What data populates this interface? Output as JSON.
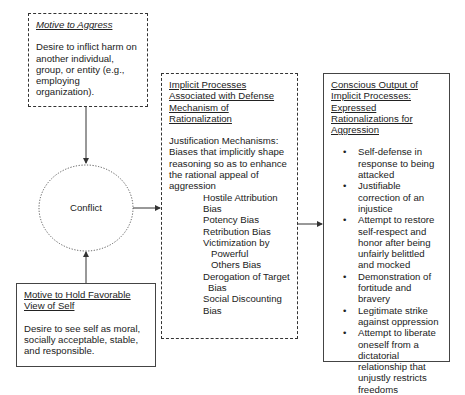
{
  "boxes": {
    "motive_aggress": {
      "title": "Motive to Aggress",
      "body": "Desire to inflict harm on another individual, group, or entity (e.g., employing organization)."
    },
    "motive_self": {
      "title": "Motive to Hold Favorable View of Self",
      "body": "Desire to see self as moral, socially acceptable, stable, and responsible."
    },
    "conflict": {
      "label": "Conflict"
    },
    "implicit": {
      "title": "Implicit Processes Associated with Defense Mechanism of Rationalization",
      "intro": "Justification Mechanisms: Biases that implicitly shape reasoning so as to enhance the rational appeal of aggression",
      "biases": [
        {
          "main": "Hostile Attribution Bias"
        },
        {
          "main": "Potency Bias"
        },
        {
          "main": "Retribution Bias"
        },
        {
          "main": "Victimization by",
          "cont1": "Powerful",
          "cont2": "Others Bias"
        },
        {
          "main": "Derogation of Target",
          "cont1": "Bias"
        },
        {
          "main": "Social Discounting Bias"
        }
      ]
    },
    "conscious": {
      "title": "Conscious Output of Implicit Processes: Expressed Rationalizations for Aggression",
      "items": [
        "Self-defense in response to being attacked",
        "Justifiable correction of an injustice",
        "Attempt to restore self-respect and honor after being unfairly belittled and mocked",
        "Demonstration of fortitude and bravery",
        "Legitimate strike against oppression",
        "Attempt to liberate oneself from a dictatorial relationship that unjustly restricts freedoms"
      ]
    }
  },
  "colors": {
    "line": "#333333",
    "text": "#222222",
    "background": "#ffffff"
  }
}
